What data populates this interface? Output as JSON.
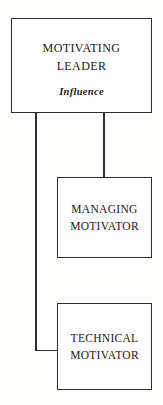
{
  "diagram": {
    "type": "hierarchy-flowchart",
    "background_color": "#fdfdfc",
    "line_color": "#2e2e2e",
    "text_color": "#181818",
    "nodes": [
      {
        "id": "motivating-leader",
        "title_line_1": "Motivating",
        "title_line_2": "Leader",
        "subtitle": "Influence"
      },
      {
        "id": "managing-motivator",
        "label_line_1": "MANAGING",
        "label_line_2": "MOTIVATOR"
      },
      {
        "id": "technical-motivator",
        "label_line_1": "TECHNICAL",
        "label_line_2": "MOTIVATOR"
      }
    ],
    "connectors": [
      {
        "id": "to-managing",
        "from": "motivating-leader",
        "to": "managing-motivator",
        "style": "straight-vertical"
      },
      {
        "id": "to-technical",
        "from": "motivating-leader",
        "to": "technical-motivator",
        "style": "elbow-left"
      }
    ]
  }
}
